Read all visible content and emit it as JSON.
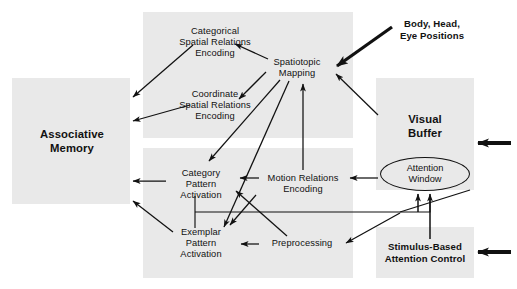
{
  "diagram": {
    "background_color": "#ffffff",
    "region_color": "#e9e9e9",
    "stroke_color": "#111111",
    "regions": [
      {
        "name": "associative-memory-region",
        "label": "Associative\nMemory",
        "x": 12,
        "y": 78,
        "w": 118,
        "h": 126
      },
      {
        "name": "spatial-relations-region",
        "label": "",
        "x": 143,
        "y": 12,
        "w": 210,
        "h": 126
      },
      {
        "name": "pattern-activation-region",
        "label": "",
        "x": 143,
        "y": 148,
        "w": 210,
        "h": 130
      },
      {
        "name": "visual-buffer-region",
        "label": "Visual\nBuffer",
        "x": 376,
        "y": 78,
        "w": 98,
        "h": 112
      },
      {
        "name": "stimulus-attention-region",
        "label": "",
        "x": 376,
        "y": 227,
        "w": 98,
        "h": 51
      }
    ],
    "nodes": [
      {
        "name": "node-associative-memory",
        "label": "Associative\nMemory",
        "style": "big",
        "x": 28,
        "y": 127,
        "w": 88
      },
      {
        "name": "node-categorical-spatial-relations-encoding",
        "label": "Categorical\nSpatial Relations\nEncoding",
        "style": "plain",
        "x": 156,
        "y": 26,
        "w": 118
      },
      {
        "name": "node-coordinate-spatial-relations-encoding",
        "label": "Coordinate\nSpatial Relations\nEncoding",
        "style": "plain",
        "x": 156,
        "y": 89,
        "w": 118
      },
      {
        "name": "node-spatiotopic-mapping",
        "label": "Spatiotopic\nMapping",
        "style": "plain",
        "x": 264,
        "y": 57,
        "w": 66
      },
      {
        "name": "node-body-head-eye-positions",
        "label": "Body, Head,\nEye Positions",
        "style": "bold",
        "x": 392,
        "y": 18,
        "w": 76
      },
      {
        "name": "node-visual-buffer",
        "label": "Visual\nBuffer",
        "style": "big",
        "x": 392,
        "y": 114,
        "w": 66
      },
      {
        "name": "node-category-pattern-activation",
        "label": "Category\nPattern\nActivation",
        "style": "plain",
        "x": 168,
        "y": 167,
        "w": 68
      },
      {
        "name": "node-exemplar-pattern-activation",
        "label": "Exemplar\nPattern\nActivation",
        "style": "plain",
        "x": 168,
        "y": 226,
        "w": 68
      },
      {
        "name": "node-motion-relations-encoding",
        "label": "Motion Relations\nEncoding",
        "style": "plain",
        "x": 262,
        "y": 174,
        "w": 82
      },
      {
        "name": "node-preprocessing",
        "label": "Preprocessing",
        "style": "plain",
        "x": 262,
        "y": 239,
        "w": 78
      },
      {
        "name": "node-stimulus-based-attention-control",
        "label": "Stimulus-Based\nAttention Control",
        "style": "bold",
        "x": 381,
        "y": 241,
        "w": 88
      }
    ],
    "ellipses": [
      {
        "name": "node-attention-window",
        "label": "Attention\nWindow",
        "x": 380,
        "y": 157,
        "w": 90,
        "h": 34
      }
    ],
    "external_arrows": [
      {
        "name": "external-input-arrow-visual-buffer",
        "x": 474,
        "y": 143,
        "length": 36
      },
      {
        "name": "external-input-arrow-attention-control",
        "x": 474,
        "y": 252,
        "length": 36
      }
    ],
    "connections": [
      {
        "name": "arrow-categorical-to-associative-memory",
        "from": "node-categorical-spatial-relations-encoding",
        "to": "node-associative-memory",
        "x1": 193,
        "y1": 45,
        "x2": 131,
        "y2": 97
      },
      {
        "name": "arrow-coordinate-to-associative-memory",
        "from": "node-coordinate-spatial-relations-encoding",
        "to": "node-associative-memory",
        "x1": 190,
        "y1": 105,
        "x2": 131,
        "y2": 121
      },
      {
        "name": "arrow-spatiotopic-to-categorical",
        "from": "node-spatiotopic-mapping",
        "to": "node-categorical-spatial-relations-encoding",
        "x1": 268,
        "y1": 58,
        "x2": 233,
        "y2": 44
      },
      {
        "name": "arrow-spatiotopic-to-coordinate",
        "from": "node-spatiotopic-mapping",
        "to": "node-coordinate-spatial-relations-encoding",
        "x1": 267,
        "y1": 73,
        "x2": 238,
        "y2": 99
      },
      {
        "name": "arrow-spatiotopic-to-category-pattern",
        "from": "node-spatiotopic-mapping",
        "to": "node-category-pattern-activation",
        "x1": 279,
        "y1": 80,
        "x2": 207,
        "y2": 160
      },
      {
        "name": "arrow-spatiotopic-to-exemplar-pattern",
        "from": "node-spatiotopic-mapping",
        "to": "node-exemplar-pattern-activation",
        "x1": 288,
        "y1": 80,
        "x2": 222,
        "y2": 226
      },
      {
        "name": "arrow-body-head-eye-to-spatiotopic",
        "from": "node-body-head-eye-positions",
        "to": "node-spatiotopic-mapping",
        "x1": 390,
        "y1": 26,
        "x2": 333,
        "y2": 65,
        "thick": true
      },
      {
        "name": "arrow-visual-buffer-to-spatiotopic",
        "from": "node-visual-buffer",
        "to": "node-spatiotopic-mapping",
        "x1": 378,
        "y1": 114,
        "x2": 334,
        "y2": 74
      },
      {
        "name": "arrow-motion-relations-to-spatiotopic",
        "from": "node-motion-relations-encoding",
        "to": "node-spatiotopic-mapping",
        "x1": 303,
        "y1": 170,
        "x2": 303,
        "y2": 82
      },
      {
        "name": "arrow-motion-relations-to-category-pattern",
        "from": "node-motion-relations-encoding",
        "to": "node-category-pattern-activation",
        "x1": 258,
        "y1": 178,
        "x2": 238,
        "y2": 178
      },
      {
        "name": "arrow-attention-window-to-motion-relations",
        "from": "node-attention-window",
        "to": "node-motion-relations-encoding",
        "x1": 378,
        "y1": 178,
        "x2": 348,
        "y2": 178
      },
      {
        "name": "arrow-preprocessing-to-exemplar-pattern",
        "from": "node-preprocessing",
        "to": "node-exemplar-pattern-activation",
        "x1": 258,
        "y1": 244,
        "x2": 240,
        "y2": 244
      },
      {
        "name": "arrow-preprocessing-to-category-pattern",
        "from": "node-preprocessing",
        "to": "node-category-pattern-activation",
        "x1": 284,
        "y1": 235,
        "x2": 234,
        "y2": 190
      },
      {
        "name": "arrow-attention-window-to-preprocessing",
        "from": "node-attention-window",
        "to": "node-preprocessing",
        "x1": 398,
        "y1": 212,
        "x2": 344,
        "y2": 243
      },
      {
        "name": "arrow-category-pattern-to-associative-memory",
        "from": "node-category-pattern-activation",
        "to": "node-associative-memory",
        "x1": 166,
        "y1": 180,
        "x2": 131,
        "y2": 180
      },
      {
        "name": "arrow-exemplar-pattern-to-associative-memory",
        "from": "node-exemplar-pattern-activation",
        "to": "node-associative-memory",
        "x1": 172,
        "y1": 231,
        "x2": 131,
        "y2": 200
      },
      {
        "name": "arrow-preprocessing-to-exemplar-down",
        "from": "node-preprocessing",
        "to": "node-exemplar-pattern-activation",
        "x1": 255,
        "y1": 194,
        "x2": 228,
        "y2": 224
      },
      {
        "name": "arrow-attention-window-feedback",
        "from": "node-attention-window",
        "to": "node-category-exemplar-bus",
        "x1": 425,
        "y1": 193,
        "x2": 195,
        "y2": 212
      },
      {
        "name": "arrow-attention-control-to-attention-window-left",
        "from": "node-stimulus-based-attention-control",
        "to": "node-attention-window",
        "x1": 418,
        "y1": 212,
        "x2": 418,
        "y2": 193
      },
      {
        "name": "arrow-attention-control-to-attention-window-right",
        "from": "node-stimulus-based-attention-control",
        "to": "node-attention-window",
        "x1": 430,
        "y1": 240,
        "x2": 430,
        "y2": 193
      }
    ]
  }
}
